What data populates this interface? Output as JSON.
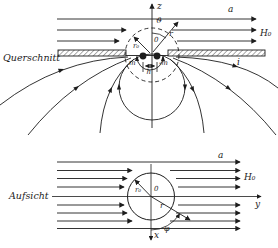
{
  "figure": {
    "querschnitt": {
      "section_label": "Querschnitt",
      "z_axis_label": "z",
      "region_label": "a",
      "field_label": "H₀",
      "induced_field_label": "i",
      "polar_angle_label": "ϑ",
      "radius_vector_label": "r",
      "sphere_radius_label": "r₀",
      "origin_label": "0",
      "pole_left_label": "m",
      "pole_right_label": "-m",
      "pole_distance_label": "h"
    },
    "aufsicht": {
      "section_label": "Aufsicht",
      "region_label": "a",
      "field_label": "H₀",
      "y_axis_label": "y",
      "x_axis_label": "x",
      "origin_label": "0",
      "sphere_radius_label": "r₀",
      "radius_vector_label": "r",
      "azimuth_angle_label": "φ"
    },
    "colors": {
      "ink": "#1d1d1d",
      "paper": "#ffffff"
    }
  }
}
